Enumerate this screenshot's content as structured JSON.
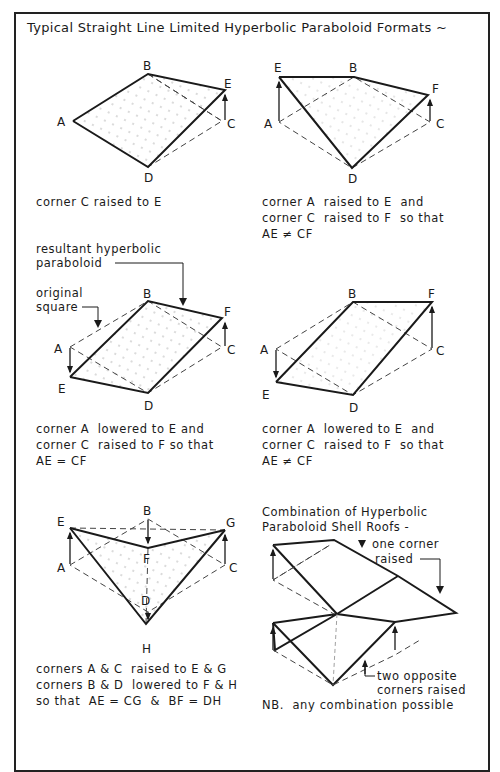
{
  "title": "Typical Straight Line Limited Hyperbolic Paraboloid Formats ~",
  "panels": [
    {
      "id": "p1",
      "labels": {
        "A": "A",
        "B": "B",
        "C": "C",
        "D": "D",
        "E": "E"
      },
      "caption": [
        "corner C raised to E"
      ]
    },
    {
      "id": "p2",
      "labels": {
        "A": "A",
        "B": "B",
        "C": "C",
        "D": "D",
        "E": "E",
        "F": "F"
      },
      "caption": [
        "corner A  raised to E  and",
        "corner C  raised to F  so that",
        "AE ≠ CF"
      ]
    },
    {
      "id": "p3",
      "labels": {
        "A": "A",
        "B": "B",
        "C": "C",
        "D": "D",
        "E": "E",
        "F": "F"
      },
      "annotations": {
        "resultant": [
          "resultant hyperbolic",
          "paraboloid"
        ],
        "original": [
          "original",
          "square"
        ]
      },
      "caption": [
        "corner A  lowered to E and",
        "corner C  raised to F so that",
        "AE = CF"
      ]
    },
    {
      "id": "p4",
      "labels": {
        "A": "A",
        "B": "B",
        "C": "C",
        "D": "D",
        "E": "E",
        "F": "F"
      },
      "caption": [
        "corner A  lowered to E  and",
        "corner C  raised to F  so that",
        "AE ≠ CF"
      ]
    },
    {
      "id": "p5",
      "labels": {
        "A": "A",
        "B": "B",
        "C": "C",
        "D": "D",
        "E": "E",
        "F": "F",
        "G": "G",
        "H": "H"
      },
      "caption": [
        "corners A & C  raised to E & G",
        "corners B & D  lowered to F & H",
        "so that  AE = CG  &  BF = DH"
      ]
    },
    {
      "id": "p6",
      "heading": [
        "Combination of Hyperbolic",
        "Paraboloid Shell Roofs -"
      ],
      "annotations": {
        "one_corner": [
          "one corner",
          "raised"
        ],
        "two_corners": [
          "two opposite",
          "corners raised"
        ]
      },
      "caption": [
        "NB.  any combination possible"
      ]
    }
  ],
  "colors": {
    "ink": "#1a1a1a",
    "dash": "#444444",
    "stipple": "#9a9a9a",
    "background": "#ffffff"
  }
}
